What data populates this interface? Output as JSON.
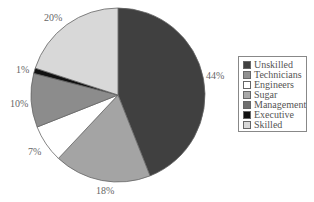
{
  "chart_data": {
    "type": "pie",
    "title": "",
    "start_angle_deg": 0,
    "direction": "clockwise",
    "slices": [
      {
        "label": "Unskilled",
        "value": 44,
        "display": "44%",
        "color": "#404040"
      },
      {
        "label": "Technicians",
        "value": 18,
        "display": "18%",
        "color": "#a4a4a4"
      },
      {
        "label": "Engineers",
        "value": 7,
        "display": "7%",
        "color": "#ffffff"
      },
      {
        "label": "Sugar",
        "value": 10,
        "display": "10%",
        "color": "#8c8c8c"
      },
      {
        "label": "Management",
        "value": 0,
        "display": "",
        "color": "#707070"
      },
      {
        "label": "Executive",
        "value": 1,
        "display": "1%",
        "color": "#111111"
      },
      {
        "label": "Skilled",
        "value": 20,
        "display": "20%",
        "color": "#d8d8d8"
      }
    ],
    "legend": {
      "position": "right",
      "entries": [
        "Unskilled",
        "Technicians",
        "Engineers",
        "Sugar",
        "Management",
        "Executive",
        "Skilled"
      ]
    }
  },
  "labels": {
    "unskilled": "44%",
    "technicians": "18%",
    "engineers": "7%",
    "sugar": "10%",
    "executive": "1%",
    "skilled": "20%"
  },
  "legend": {
    "items": [
      {
        "label": "Unskilled",
        "color": "#404040"
      },
      {
        "label": "Technicians",
        "color": "#909090"
      },
      {
        "label": "Engineers",
        "color": "#ffffff"
      },
      {
        "label": "Sugar",
        "color": "#a8a8a8"
      },
      {
        "label": "Management",
        "color": "#707070"
      },
      {
        "label": "Executive",
        "color": "#111111"
      },
      {
        "label": "Skilled",
        "color": "#d8d8d8"
      }
    ]
  }
}
